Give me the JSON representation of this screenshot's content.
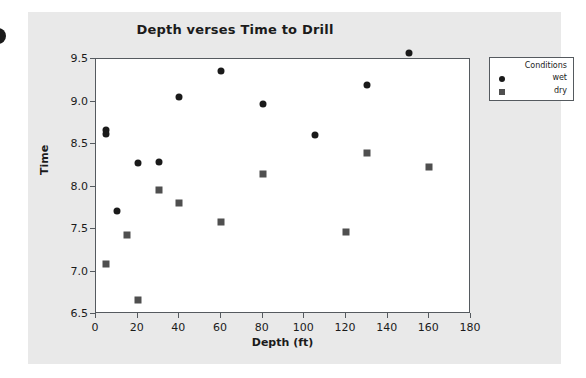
{
  "figure": {
    "title": "Depth verses Time to Drill",
    "background_color": "#e9e9e9",
    "plot_background_color": "#ffffff",
    "frame_color": "#555a5f"
  },
  "legend": {
    "title": "Conditions",
    "entries": [
      {
        "label": "wet",
        "marker": "circle",
        "color": "#1a1a1a"
      },
      {
        "label": "dry",
        "marker": "square",
        "color": "#4f4f4f"
      }
    ]
  },
  "axes": {
    "x": {
      "label": "Depth (ft)",
      "ticks": [
        "0",
        "20",
        "40",
        "60",
        "80",
        "100",
        "120",
        "140",
        "160",
        "180"
      ]
    },
    "y": {
      "label": "Time",
      "ticks": [
        "6.5",
        "7.0",
        "7.5",
        "8.0",
        "8.5",
        "9.0",
        "9.5"
      ]
    }
  },
  "chart_data": {
    "type": "scatter",
    "title": "Depth verses Time to Drill",
    "xlabel": "Depth (ft)",
    "ylabel": "Time",
    "xlim": [
      0,
      180
    ],
    "ylim": [
      6.5,
      9.5
    ],
    "xticks": [
      0,
      20,
      40,
      60,
      80,
      100,
      120,
      140,
      160,
      180
    ],
    "yticks": [
      6.5,
      7.0,
      7.5,
      8.0,
      8.5,
      9.0,
      9.5
    ],
    "grid": false,
    "legend_title": "Conditions",
    "legend_position": "outside-top-right",
    "series": [
      {
        "name": "wet",
        "marker": "circle",
        "color": "#1a1a1a",
        "points": [
          {
            "x": 5,
            "y": 8.67
          },
          {
            "x": 5,
            "y": 8.62
          },
          {
            "x": 10,
            "y": 7.71
          },
          {
            "x": 20,
            "y": 8.28
          },
          {
            "x": 30,
            "y": 8.29
          },
          {
            "x": 40,
            "y": 9.05
          },
          {
            "x": 60,
            "y": 9.36
          },
          {
            "x": 80,
            "y": 8.97
          },
          {
            "x": 105,
            "y": 8.61
          },
          {
            "x": 130,
            "y": 9.2
          },
          {
            "x": 150,
            "y": 9.57
          }
        ]
      },
      {
        "name": "dry",
        "marker": "square",
        "color": "#4f4f4f",
        "points": [
          {
            "x": 5,
            "y": 7.09
          },
          {
            "x": 15,
            "y": 7.43
          },
          {
            "x": 20,
            "y": 6.66
          },
          {
            "x": 30,
            "y": 7.96
          },
          {
            "x": 40,
            "y": 7.81
          },
          {
            "x": 60,
            "y": 7.58
          },
          {
            "x": 80,
            "y": 8.15
          },
          {
            "x": 120,
            "y": 7.47
          },
          {
            "x": 130,
            "y": 8.39
          },
          {
            "x": 160,
            "y": 8.23
          }
        ]
      }
    ]
  }
}
